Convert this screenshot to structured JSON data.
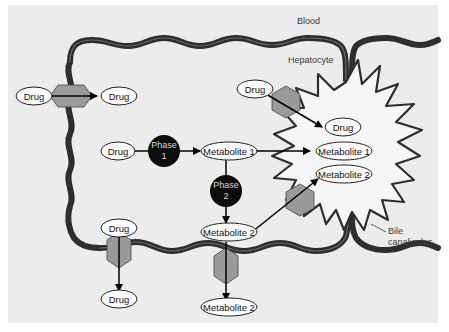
{
  "diagram": {
    "colors": {
      "panel": "#ececec",
      "membrane": "#2e2e2e",
      "membrane_core": "#5a5a5a",
      "transporter": "#9a9a9a",
      "phase_node": "#0c0c0c",
      "oval_fill": "#ffffff",
      "arrow": "#000000"
    },
    "regions": {
      "blood": "Blood",
      "hepatocyte": "Hepatocyte",
      "bile_canaliculus_line1": "Bile",
      "bile_canaliculus_line2": "canaliculus"
    },
    "phases": {
      "phase1_line1": "Phase",
      "phase1_line2": "1",
      "phase2_line1": "Phase",
      "phase2_line2": "2"
    },
    "nodes": {
      "blood_drug_in": "Drug",
      "blood_drug_out": "Drug",
      "cell_drug": "Drug",
      "metabolite1": "Metabolite 1",
      "metabolite2": "Metabolite 2",
      "canal_drug_source": "Drug",
      "canal_drug": "Drug",
      "canal_metabolite1": "Metabolite 1",
      "canal_metabolite2": "Metabolite 2",
      "bottom_drug_in": "Drug",
      "bottom_drug_out": "Drug",
      "bottom_metabolite2_out": "Metabolite 2"
    }
  }
}
